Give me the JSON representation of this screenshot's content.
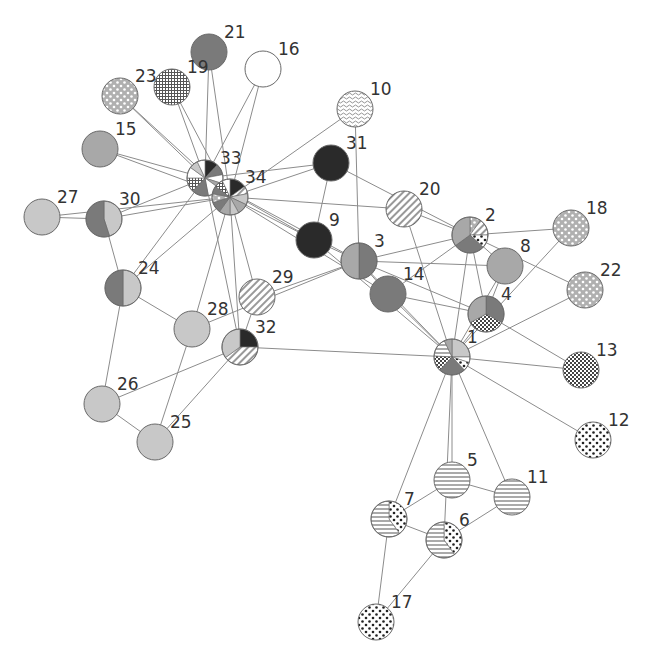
{
  "diagram": {
    "title": "",
    "type": "network-graph-with-pie-nodes",
    "fills": {
      "light": "#c8c8c8",
      "mid": "#a8a8a8",
      "dark": "#7a7a7a",
      "black": "#2a2a2a",
      "white": "#ffffff",
      "hstripe": "hstripe",
      "diag": "diag",
      "dots": "dots",
      "whitedots": "whitedots",
      "grid": "grid",
      "check": "check",
      "wave": "wave"
    },
    "nodes": [
      {
        "id": "1",
        "x": 452,
        "y": 357,
        "slices": [
          [
            "light",
            0.25
          ],
          [
            "white",
            0.05
          ],
          [
            "dots",
            0.08
          ],
          [
            "dark",
            0.24
          ],
          [
            "check",
            0.14
          ],
          [
            "hstripe",
            0.17
          ],
          [
            "mid",
            0.07
          ]
        ]
      },
      {
        "id": "2",
        "x": 470,
        "y": 235,
        "slices": [
          [
            "whitedots",
            0.1
          ],
          [
            "diag",
            0.15
          ],
          [
            "dots",
            0.12
          ],
          [
            "dark",
            0.28
          ],
          [
            "mid",
            0.35
          ]
        ]
      },
      {
        "id": "3",
        "x": 359,
        "y": 261,
        "slices": [
          [
            "dark",
            0.5
          ],
          [
            "mid",
            0.5
          ]
        ]
      },
      {
        "id": "4",
        "x": 486,
        "y": 314,
        "slices": [
          [
            "dark",
            0.33
          ],
          [
            "check",
            0.34
          ],
          [
            "mid",
            0.33
          ]
        ]
      },
      {
        "id": "5",
        "x": 452,
        "y": 480,
        "slices": [
          [
            "hstripe",
            1
          ]
        ]
      },
      {
        "id": "6",
        "x": 444,
        "y": 540,
        "slices": [
          [
            "dots",
            0.4
          ],
          [
            "hstripe",
            0.6
          ]
        ]
      },
      {
        "id": "7",
        "x": 389,
        "y": 519,
        "slices": [
          [
            "dots",
            0.4
          ],
          [
            "hstripe",
            0.6
          ]
        ]
      },
      {
        "id": "8",
        "x": 505,
        "y": 266,
        "slices": [
          [
            "mid",
            1
          ]
        ]
      },
      {
        "id": "9",
        "x": 314,
        "y": 240,
        "slices": [
          [
            "black",
            1
          ]
        ]
      },
      {
        "id": "10",
        "x": 355,
        "y": 109,
        "slices": [
          [
            "wave",
            1
          ]
        ]
      },
      {
        "id": "11",
        "x": 512,
        "y": 497,
        "slices": [
          [
            "hstripe",
            1
          ]
        ]
      },
      {
        "id": "12",
        "x": 593,
        "y": 440,
        "slices": [
          [
            "dots",
            1
          ]
        ]
      },
      {
        "id": "13",
        "x": 581,
        "y": 370,
        "slices": [
          [
            "check",
            1
          ]
        ]
      },
      {
        "id": "14",
        "x": 388,
        "y": 294,
        "slices": [
          [
            "dark",
            1
          ]
        ]
      },
      {
        "id": "15",
        "x": 100,
        "y": 149,
        "slices": [
          [
            "mid",
            1
          ]
        ]
      },
      {
        "id": "16",
        "x": 263,
        "y": 69,
        "slices": [
          [
            "white",
            1
          ]
        ]
      },
      {
        "id": "17",
        "x": 376,
        "y": 622,
        "slices": [
          [
            "dots",
            1
          ]
        ]
      },
      {
        "id": "18",
        "x": 571,
        "y": 228,
        "slices": [
          [
            "whitedots",
            1
          ]
        ]
      },
      {
        "id": "19",
        "x": 172,
        "y": 87,
        "slices": [
          [
            "grid",
            1
          ]
        ]
      },
      {
        "id": "20",
        "x": 404,
        "y": 209,
        "slices": [
          [
            "diag",
            1
          ]
        ]
      },
      {
        "id": "21",
        "x": 209,
        "y": 52,
        "slices": [
          [
            "dark",
            1
          ]
        ]
      },
      {
        "id": "22",
        "x": 585,
        "y": 290,
        "slices": [
          [
            "whitedots",
            1
          ]
        ]
      },
      {
        "id": "23",
        "x": 120,
        "y": 96,
        "slices": [
          [
            "whitedots",
            1
          ]
        ]
      },
      {
        "id": "24",
        "x": 123,
        "y": 288,
        "slices": [
          [
            "light",
            0.5
          ],
          [
            "dark",
            0.5
          ]
        ]
      },
      {
        "id": "25",
        "x": 155,
        "y": 442,
        "slices": [
          [
            "light",
            1
          ]
        ]
      },
      {
        "id": "26",
        "x": 102,
        "y": 404,
        "slices": [
          [
            "light",
            1
          ]
        ]
      },
      {
        "id": "27",
        "x": 42,
        "y": 217,
        "slices": [
          [
            "light",
            1
          ]
        ]
      },
      {
        "id": "28",
        "x": 192,
        "y": 329,
        "slices": [
          [
            "light",
            1
          ]
        ]
      },
      {
        "id": "29",
        "x": 257,
        "y": 297,
        "slices": [
          [
            "diag",
            1
          ]
        ]
      },
      {
        "id": "30",
        "x": 104,
        "y": 219,
        "slices": [
          [
            "light",
            0.45
          ],
          [
            "dark",
            0.55
          ]
        ]
      },
      {
        "id": "31",
        "x": 331,
        "y": 163,
        "slices": [
          [
            "black",
            1
          ]
        ]
      },
      {
        "id": "32",
        "x": 240,
        "y": 347,
        "slices": [
          [
            "black",
            0.25
          ],
          [
            "diag",
            0.4
          ],
          [
            "light",
            0.35
          ]
        ]
      },
      {
        "id": "33",
        "x": 205,
        "y": 178,
        "slices": [
          [
            "black",
            0.12
          ],
          [
            "dark",
            0.1
          ],
          [
            "white",
            0.08
          ],
          [
            "mid",
            0.05
          ],
          [
            "white",
            0.12
          ],
          [
            "dark",
            0.15
          ],
          [
            "grid",
            0.13
          ],
          [
            "white",
            0.1
          ],
          [
            "light",
            0.08
          ],
          [
            "white",
            0.07
          ]
        ]
      },
      {
        "id": "34",
        "x": 230,
        "y": 197,
        "slices": [
          [
            "black",
            0.15
          ],
          [
            "diag",
            0.07
          ],
          [
            "light",
            0.1
          ],
          [
            "mid",
            0.1
          ],
          [
            "light",
            0.08
          ],
          [
            "mid",
            0.1
          ],
          [
            "dark",
            0.1
          ],
          [
            "whitedots",
            0.08
          ],
          [
            "dark",
            0.07
          ],
          [
            "grid",
            0.08
          ],
          [
            "white",
            0.07
          ]
        ]
      }
    ],
    "edges": [
      [
        "1",
        "2"
      ],
      [
        "1",
        "3"
      ],
      [
        "1",
        "4"
      ],
      [
        "1",
        "5"
      ],
      [
        "1",
        "6"
      ],
      [
        "1",
        "7"
      ],
      [
        "1",
        "8"
      ],
      [
        "1",
        "9"
      ],
      [
        "1",
        "11"
      ],
      [
        "1",
        "12"
      ],
      [
        "1",
        "13"
      ],
      [
        "1",
        "14"
      ],
      [
        "1",
        "18"
      ],
      [
        "1",
        "20"
      ],
      [
        "1",
        "22"
      ],
      [
        "1",
        "32"
      ],
      [
        "2",
        "3"
      ],
      [
        "2",
        "4"
      ],
      [
        "2",
        "8"
      ],
      [
        "2",
        "14"
      ],
      [
        "2",
        "18"
      ],
      [
        "2",
        "20"
      ],
      [
        "2",
        "22"
      ],
      [
        "2",
        "31"
      ],
      [
        "3",
        "4"
      ],
      [
        "3",
        "8"
      ],
      [
        "3",
        "9"
      ],
      [
        "3",
        "10"
      ],
      [
        "3",
        "14"
      ],
      [
        "3",
        "28"
      ],
      [
        "3",
        "29"
      ],
      [
        "3",
        "33"
      ],
      [
        "4",
        "8"
      ],
      [
        "4",
        "13"
      ],
      [
        "4",
        "14"
      ],
      [
        "5",
        "7"
      ],
      [
        "5",
        "11"
      ],
      [
        "6",
        "7"
      ],
      [
        "6",
        "11"
      ],
      [
        "6",
        "17"
      ],
      [
        "7",
        "17"
      ],
      [
        "9",
        "31"
      ],
      [
        "9",
        "33"
      ],
      [
        "9",
        "34"
      ],
      [
        "10",
        "34"
      ],
      [
        "14",
        "34"
      ],
      [
        "15",
        "33"
      ],
      [
        "15",
        "34"
      ],
      [
        "16",
        "33"
      ],
      [
        "16",
        "34"
      ],
      [
        "19",
        "33"
      ],
      [
        "19",
        "34"
      ],
      [
        "20",
        "34"
      ],
      [
        "21",
        "33"
      ],
      [
        "21",
        "34"
      ],
      [
        "23",
        "33"
      ],
      [
        "23",
        "34"
      ],
      [
        "24",
        "26"
      ],
      [
        "24",
        "28"
      ],
      [
        "24",
        "30"
      ],
      [
        "24",
        "33"
      ],
      [
        "24",
        "34"
      ],
      [
        "25",
        "26"
      ],
      [
        "25",
        "28"
      ],
      [
        "25",
        "32"
      ],
      [
        "26",
        "32"
      ],
      [
        "27",
        "30"
      ],
      [
        "27",
        "34"
      ],
      [
        "28",
        "34"
      ],
      [
        "29",
        "32"
      ],
      [
        "29",
        "34"
      ],
      [
        "30",
        "33"
      ],
      [
        "30",
        "34"
      ],
      [
        "31",
        "33"
      ],
      [
        "31",
        "34"
      ],
      [
        "32",
        "33"
      ],
      [
        "32",
        "34"
      ],
      [
        "33",
        "34"
      ]
    ]
  }
}
